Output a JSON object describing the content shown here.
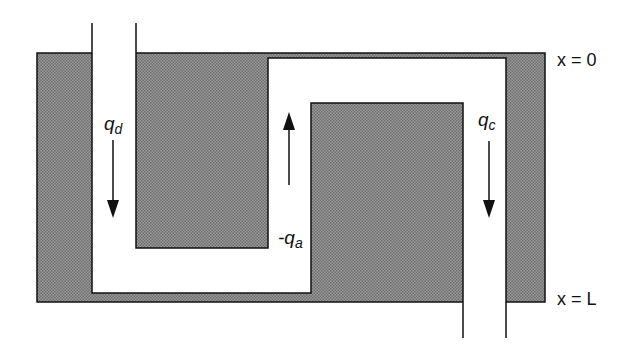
{
  "diagram": {
    "type": "flow channel schematic",
    "colors": {
      "solid": "#8a8a8a",
      "channel": "#ffffff",
      "line": "#111111"
    },
    "labels": {
      "q_d": {
        "base": "q",
        "sub": "d"
      },
      "q_a": {
        "prefix": "-",
        "base": "q",
        "sub": "a"
      },
      "q_c": {
        "base": "q",
        "sub": "c"
      },
      "x_top": "x = 0",
      "x_bottom": "x = L"
    },
    "flows": [
      {
        "label": "q_d",
        "direction": "down"
      },
      {
        "label": "-q_a",
        "direction": "up"
      },
      {
        "label": "q_c",
        "direction": "down"
      }
    ]
  }
}
